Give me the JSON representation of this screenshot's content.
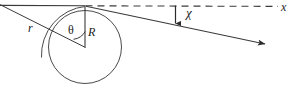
{
  "figure": {
    "stroke_color": "#3a3a3a",
    "label_color": "#1a1a1a",
    "background": "#ffffff",
    "labels": {
      "r": "r",
      "theta": "θ",
      "R": "R",
      "chi": "χ",
      "axis_x": "x"
    },
    "elements": {
      "circle_name": "scattering-circle",
      "dashed_axis_name": "dashed-x-axis",
      "incoming_line_name": "incoming-asymptote-line",
      "scattered_ray_name": "scattered-ray",
      "radius_line_name": "radius-line-R",
      "impact_line_name": "impact-parameter-line-r",
      "arc_name": "angle-arc-theta",
      "outer_arc_name": "outer-arc",
      "chi_arrow_name": "chi-angle-arrow"
    },
    "geometry": {
      "circle_center_x": 85,
      "circle_center_y": 47,
      "circle_radius": 36,
      "apex_x": 85,
      "apex_y": 6,
      "axis_y": 6,
      "axis_end_x": 278,
      "ray_end_x": 268,
      "ray_end_y": 45
    }
  }
}
